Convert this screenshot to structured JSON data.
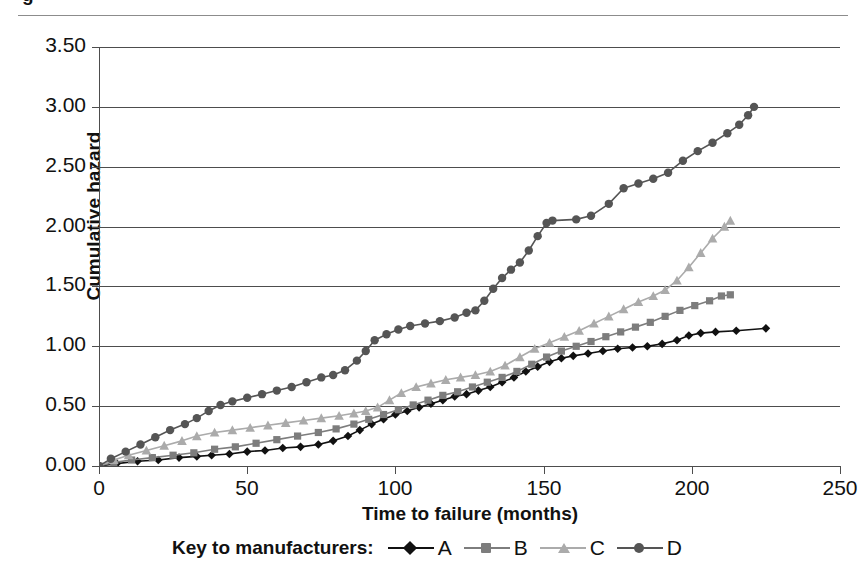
{
  "title_fragment": "g",
  "axes": {
    "y_title": "Cumulative hazard",
    "x_title": "Time to failure (months)",
    "y_ticks": [
      "0.00",
      "0.50",
      "1.00",
      "1.50",
      "2.00",
      "2.50",
      "3.00",
      "3.50"
    ],
    "x_ticks": [
      "0",
      "50",
      "100",
      "150",
      "200",
      "250"
    ]
  },
  "legend": {
    "title": "Key to manufacturers:",
    "entries": [
      {
        "label": "A",
        "color": "#111111",
        "marker": "diamond"
      },
      {
        "label": "B",
        "color": "#7d7d7d",
        "marker": "square"
      },
      {
        "label": "C",
        "color": "#ababab",
        "marker": "triangle"
      },
      {
        "label": "D",
        "color": "#555555",
        "marker": "circle"
      }
    ]
  },
  "chart_data": {
    "type": "line",
    "title": "",
    "xlabel": "Time to failure (months)",
    "ylabel": "Cumulative hazard",
    "xlim": [
      0,
      250
    ],
    "ylim": [
      0.0,
      3.5
    ],
    "xticks": [
      0,
      50,
      100,
      150,
      200,
      250
    ],
    "yticks": [
      0.0,
      0.5,
      1.0,
      1.5,
      2.0,
      2.5,
      3.0,
      3.5
    ],
    "grid": "horizontal",
    "legend_position": "bottom",
    "legend_title": "Key to manufacturers:",
    "series": [
      {
        "name": "A",
        "color": "#111111",
        "marker": "diamond",
        "points": [
          [
            0,
            0.0
          ],
          [
            6,
            0.02
          ],
          [
            13,
            0.04
          ],
          [
            20,
            0.05
          ],
          [
            27,
            0.07
          ],
          [
            33,
            0.08
          ],
          [
            38,
            0.09
          ],
          [
            44,
            0.1
          ],
          [
            50,
            0.12
          ],
          [
            56,
            0.13
          ],
          [
            62,
            0.15
          ],
          [
            68,
            0.16
          ],
          [
            74,
            0.18
          ],
          [
            79,
            0.21
          ],
          [
            84,
            0.25
          ],
          [
            88,
            0.3
          ],
          [
            92,
            0.35
          ],
          [
            96,
            0.39
          ],
          [
            100,
            0.43
          ],
          [
            104,
            0.46
          ],
          [
            108,
            0.49
          ],
          [
            112,
            0.52
          ],
          [
            116,
            0.55
          ],
          [
            120,
            0.58
          ],
          [
            124,
            0.6
          ],
          [
            128,
            0.63
          ],
          [
            132,
            0.66
          ],
          [
            136,
            0.7
          ],
          [
            140,
            0.74
          ],
          [
            144,
            0.79
          ],
          [
            148,
            0.83
          ],
          [
            152,
            0.87
          ],
          [
            156,
            0.9
          ],
          [
            160,
            0.92
          ],
          [
            165,
            0.94
          ],
          [
            170,
            0.96
          ],
          [
            175,
            0.98
          ],
          [
            180,
            0.99
          ],
          [
            185,
            1.0
          ],
          [
            190,
            1.02
          ],
          [
            195,
            1.05
          ],
          [
            199,
            1.09
          ],
          [
            203,
            1.11
          ],
          [
            208,
            1.12
          ],
          [
            215,
            1.13
          ],
          [
            225,
            1.15
          ]
        ]
      },
      {
        "name": "B",
        "color": "#7d7d7d",
        "marker": "square",
        "points": [
          [
            0,
            0.0
          ],
          [
            5,
            0.03
          ],
          [
            11,
            0.05
          ],
          [
            18,
            0.07
          ],
          [
            25,
            0.09
          ],
          [
            32,
            0.11
          ],
          [
            39,
            0.14
          ],
          [
            46,
            0.16
          ],
          [
            53,
            0.19
          ],
          [
            60,
            0.22
          ],
          [
            67,
            0.25
          ],
          [
            74,
            0.28
          ],
          [
            80,
            0.31
          ],
          [
            86,
            0.35
          ],
          [
            91,
            0.39
          ],
          [
            96,
            0.43
          ],
          [
            101,
            0.47
          ],
          [
            106,
            0.51
          ],
          [
            111,
            0.55
          ],
          [
            116,
            0.59
          ],
          [
            121,
            0.62
          ],
          [
            126,
            0.66
          ],
          [
            131,
            0.7
          ],
          [
            136,
            0.74
          ],
          [
            141,
            0.79
          ],
          [
            146,
            0.85
          ],
          [
            151,
            0.91
          ],
          [
            156,
            0.96
          ],
          [
            161,
            1.0
          ],
          [
            166,
            1.04
          ],
          [
            171,
            1.08
          ],
          [
            176,
            1.12
          ],
          [
            181,
            1.16
          ],
          [
            186,
            1.2
          ],
          [
            191,
            1.25
          ],
          [
            196,
            1.3
          ],
          [
            201,
            1.34
          ],
          [
            206,
            1.38
          ],
          [
            210,
            1.42
          ],
          [
            213,
            1.43
          ]
        ]
      },
      {
        "name": "C",
        "color": "#ababab",
        "marker": "triangle",
        "points": [
          [
            0,
            0.0
          ],
          [
            5,
            0.05
          ],
          [
            10,
            0.09
          ],
          [
            16,
            0.13
          ],
          [
            22,
            0.17
          ],
          [
            28,
            0.21
          ],
          [
            33,
            0.25
          ],
          [
            39,
            0.28
          ],
          [
            45,
            0.3
          ],
          [
            51,
            0.32
          ],
          [
            57,
            0.34
          ],
          [
            63,
            0.36
          ],
          [
            69,
            0.38
          ],
          [
            75,
            0.4
          ],
          [
            81,
            0.42
          ],
          [
            86,
            0.44
          ],
          [
            90,
            0.46
          ],
          [
            94,
            0.49
          ],
          [
            98,
            0.55
          ],
          [
            102,
            0.61
          ],
          [
            107,
            0.66
          ],
          [
            112,
            0.69
          ],
          [
            117,
            0.72
          ],
          [
            122,
            0.74
          ],
          [
            127,
            0.76
          ],
          [
            132,
            0.79
          ],
          [
            137,
            0.84
          ],
          [
            142,
            0.91
          ],
          [
            147,
            0.98
          ],
          [
            152,
            1.03
          ],
          [
            157,
            1.08
          ],
          [
            162,
            1.13
          ],
          [
            167,
            1.19
          ],
          [
            172,
            1.25
          ],
          [
            177,
            1.31
          ],
          [
            182,
            1.37
          ],
          [
            187,
            1.42
          ],
          [
            191,
            1.47
          ],
          [
            195,
            1.55
          ],
          [
            199,
            1.66
          ],
          [
            203,
            1.78
          ],
          [
            207,
            1.9
          ],
          [
            211,
            2.0
          ],
          [
            213,
            2.05
          ]
        ]
      },
      {
        "name": "D",
        "color": "#555555",
        "marker": "circle",
        "points": [
          [
            0,
            0.0
          ],
          [
            4,
            0.06
          ],
          [
            9,
            0.12
          ],
          [
            14,
            0.18
          ],
          [
            19,
            0.24
          ],
          [
            24,
            0.3
          ],
          [
            29,
            0.35
          ],
          [
            33,
            0.4
          ],
          [
            37,
            0.46
          ],
          [
            41,
            0.51
          ],
          [
            45,
            0.54
          ],
          [
            50,
            0.57
          ],
          [
            55,
            0.6
          ],
          [
            60,
            0.63
          ],
          [
            65,
            0.66
          ],
          [
            70,
            0.7
          ],
          [
            75,
            0.74
          ],
          [
            79,
            0.76
          ],
          [
            83,
            0.8
          ],
          [
            87,
            0.88
          ],
          [
            90,
            0.96
          ],
          [
            93,
            1.05
          ],
          [
            97,
            1.1
          ],
          [
            101,
            1.14
          ],
          [
            105,
            1.17
          ],
          [
            110,
            1.19
          ],
          [
            115,
            1.21
          ],
          [
            120,
            1.24
          ],
          [
            124,
            1.28
          ],
          [
            127,
            1.3
          ],
          [
            130,
            1.38
          ],
          [
            133,
            1.48
          ],
          [
            136,
            1.57
          ],
          [
            139,
            1.64
          ],
          [
            142,
            1.7
          ],
          [
            145,
            1.8
          ],
          [
            148,
            1.92
          ],
          [
            151,
            2.03
          ],
          [
            153,
            2.05
          ],
          [
            161,
            2.06
          ],
          [
            166,
            2.09
          ],
          [
            172,
            2.19
          ],
          [
            177,
            2.32
          ],
          [
            182,
            2.36
          ],
          [
            187,
            2.4
          ],
          [
            192,
            2.45
          ],
          [
            197,
            2.55
          ],
          [
            202,
            2.63
          ],
          [
            207,
            2.7
          ],
          [
            212,
            2.78
          ],
          [
            216,
            2.85
          ],
          [
            219,
            2.93
          ],
          [
            221,
            3.0
          ]
        ]
      }
    ]
  }
}
